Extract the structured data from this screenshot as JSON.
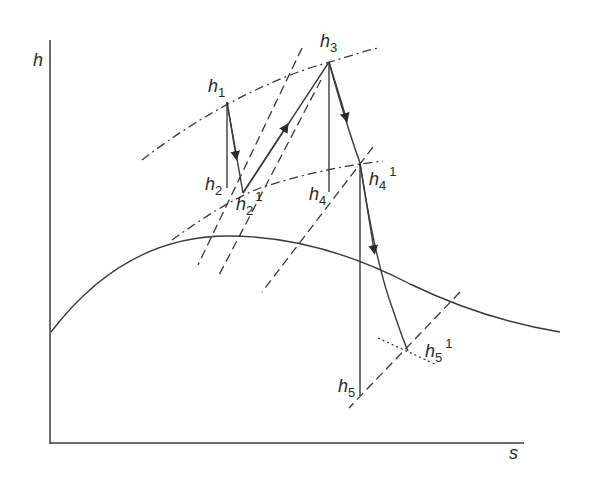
{
  "diagram": {
    "type": "h-s (Mollier) diagram, reheat steam cycle",
    "axes": {
      "y_label": "h",
      "x_label": "s"
    },
    "points": [
      {
        "id": "h1",
        "base": "h",
        "sub": "1",
        "sup": ""
      },
      {
        "id": "h2",
        "base": "h",
        "sub": "2",
        "sup": ""
      },
      {
        "id": "h2_1",
        "base": "h",
        "sub": "2",
        "sup": "1"
      },
      {
        "id": "h3",
        "base": "h",
        "sub": "3",
        "sup": ""
      },
      {
        "id": "h4",
        "base": "h",
        "sub": "4",
        "sup": ""
      },
      {
        "id": "h4_1",
        "base": "h",
        "sub": "4",
        "sup": "1"
      },
      {
        "id": "h5",
        "base": "h",
        "sub": "5",
        "sup": ""
      },
      {
        "id": "h5_1",
        "base": "h",
        "sub": "5",
        "sup": "1"
      }
    ],
    "line_styles": {
      "saturation_curve": "solid",
      "isobars": "dash-dot",
      "constant_lines": "dashed",
      "h5_1_marker": "dotted"
    },
    "colors": {
      "ink": "#3a3a3a",
      "background": "#ffffff"
    }
  }
}
